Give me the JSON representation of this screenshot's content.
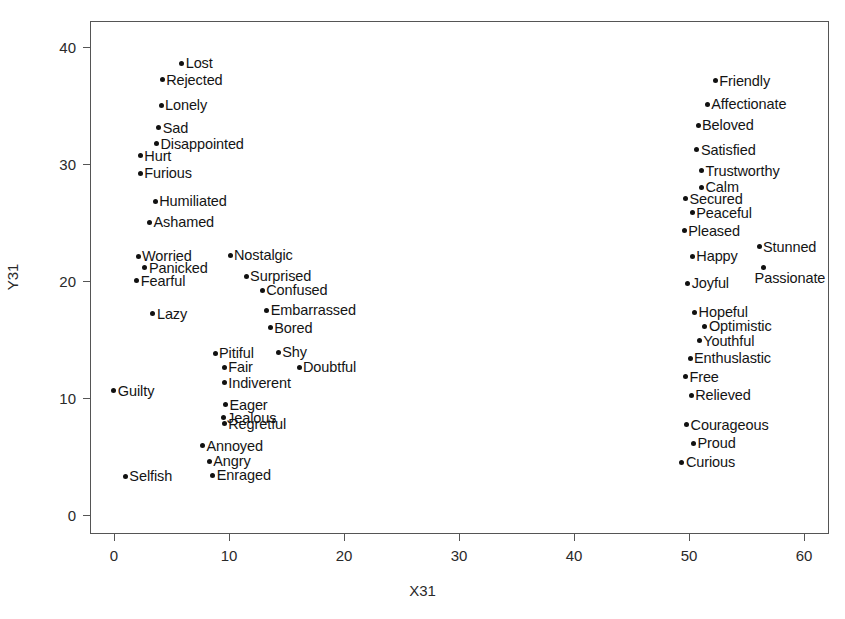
{
  "chart_data": {
    "type": "scatter",
    "title": "",
    "xlabel": "X31",
    "ylabel": "Y31",
    "xlim": [
      -2.1,
      62.5
    ],
    "ylim": [
      -1.8,
      42.2
    ],
    "xticks": [
      0,
      10,
      20,
      30,
      40,
      50,
      60
    ],
    "yticks": [
      0,
      10,
      20,
      30,
      40
    ],
    "grid": false,
    "legend": null,
    "marker": "filled-circle",
    "marker_color": "#111111",
    "points": [
      {
        "label": "Lost",
        "x": 5.8,
        "y": 38.7,
        "label_side": "right"
      },
      {
        "label": "Rejected",
        "x": 4.1,
        "y": 37.3,
        "label_side": "right"
      },
      {
        "label": "Lonely",
        "x": 4.0,
        "y": 35.1,
        "label_side": "right"
      },
      {
        "label": "Sad",
        "x": 3.8,
        "y": 33.2,
        "label_side": "right"
      },
      {
        "label": "Disappointed",
        "x": 3.6,
        "y": 31.8,
        "label_side": "right"
      },
      {
        "label": "Hurt",
        "x": 2.2,
        "y": 30.8,
        "label_side": "right"
      },
      {
        "label": "Furious",
        "x": 2.2,
        "y": 29.3,
        "label_side": "right"
      },
      {
        "label": "Humiliated",
        "x": 3.5,
        "y": 26.9,
        "label_side": "right"
      },
      {
        "label": "Ashamed",
        "x": 3.0,
        "y": 25.1,
        "label_side": "right"
      },
      {
        "label": "Worried",
        "x": 2.0,
        "y": 22.2,
        "label_side": "right"
      },
      {
        "label": "Nostalgic",
        "x": 10.0,
        "y": 22.3,
        "label_side": "right"
      },
      {
        "label": "Panicked",
        "x": 2.6,
        "y": 21.2,
        "label_side": "right"
      },
      {
        "label": "Fearful",
        "x": 1.9,
        "y": 20.1,
        "label_side": "right"
      },
      {
        "label": "Surprised",
        "x": 11.4,
        "y": 20.5,
        "label_side": "right"
      },
      {
        "label": "Confused",
        "x": 12.8,
        "y": 19.3,
        "label_side": "right"
      },
      {
        "label": "Embarrassed",
        "x": 13.2,
        "y": 17.6,
        "label_side": "right"
      },
      {
        "label": "Lazy",
        "x": 3.3,
        "y": 17.3,
        "label_side": "right"
      },
      {
        "label": "Bored",
        "x": 13.5,
        "y": 16.1,
        "label_side": "right"
      },
      {
        "label": "Pitiful",
        "x": 8.7,
        "y": 13.9,
        "label_side": "right"
      },
      {
        "label": "Shy",
        "x": 14.2,
        "y": 14.0,
        "label_side": "right"
      },
      {
        "label": "Fair",
        "x": 9.5,
        "y": 12.7,
        "label_side": "right"
      },
      {
        "label": "Doubtful",
        "x": 16.0,
        "y": 12.7,
        "label_side": "right"
      },
      {
        "label": "Indiverent",
        "x": 9.5,
        "y": 11.4,
        "label_side": "right"
      },
      {
        "label": "Guilty",
        "x": -0.1,
        "y": 10.7,
        "label_side": "right"
      },
      {
        "label": "Eager",
        "x": 9.6,
        "y": 9.5,
        "label_side": "right"
      },
      {
        "label": "Jealous",
        "x": 9.4,
        "y": 8.4,
        "label_side": "right"
      },
      {
        "label": "Regretful",
        "x": 9.5,
        "y": 7.9,
        "label_side": "right"
      },
      {
        "label": "Annoyed",
        "x": 7.6,
        "y": 6.0,
        "label_side": "right"
      },
      {
        "label": "Angry",
        "x": 8.2,
        "y": 4.7,
        "label_side": "right"
      },
      {
        "label": "Selfish",
        "x": 0.9,
        "y": 3.4,
        "label_side": "right"
      },
      {
        "label": "Enraged",
        "x": 8.5,
        "y": 3.5,
        "label_side": "right"
      },
      {
        "label": "Friendly",
        "x": 52.2,
        "y": 37.2,
        "label_side": "right"
      },
      {
        "label": "Affectionate",
        "x": 51.5,
        "y": 35.2,
        "label_side": "right"
      },
      {
        "label": "Beloved",
        "x": 50.7,
        "y": 33.4,
        "label_side": "right"
      },
      {
        "label": "Satisfied",
        "x": 50.6,
        "y": 31.3,
        "label_side": "right"
      },
      {
        "label": "Trustworthy",
        "x": 51.0,
        "y": 29.5,
        "label_side": "right"
      },
      {
        "label": "Calm",
        "x": 51.0,
        "y": 28.1,
        "label_side": "right"
      },
      {
        "label": "Secured",
        "x": 49.6,
        "y": 27.1,
        "label_side": "right"
      },
      {
        "label": "Peaceful",
        "x": 50.2,
        "y": 25.9,
        "label_side": "right"
      },
      {
        "label": "Pleased",
        "x": 49.5,
        "y": 24.4,
        "label_side": "right"
      },
      {
        "label": "Stunned",
        "x": 56.0,
        "y": 23.0,
        "label_side": "right"
      },
      {
        "label": "Happy",
        "x": 50.2,
        "y": 22.2,
        "label_side": "right"
      },
      {
        "label": "Passionate",
        "x": 56.4,
        "y": 21.2,
        "label_side": "below"
      },
      {
        "label": "Joyful",
        "x": 49.8,
        "y": 19.9,
        "label_side": "right"
      },
      {
        "label": "Hopeful",
        "x": 50.4,
        "y": 17.4,
        "label_side": "right"
      },
      {
        "label": "Optimistic",
        "x": 51.3,
        "y": 16.2,
        "label_side": "right"
      },
      {
        "label": "Youthful",
        "x": 50.8,
        "y": 15.0,
        "label_side": "right"
      },
      {
        "label": "Enthuslastic",
        "x": 50.0,
        "y": 13.5,
        "label_side": "right"
      },
      {
        "label": "Free",
        "x": 49.6,
        "y": 11.9,
        "label_side": "right"
      },
      {
        "label": "Relieved",
        "x": 50.1,
        "y": 10.3,
        "label_side": "right"
      },
      {
        "label": "Courageous",
        "x": 49.7,
        "y": 7.8,
        "label_side": "right"
      },
      {
        "label": "Proud",
        "x": 50.3,
        "y": 6.2,
        "label_side": "right"
      },
      {
        "label": "Curious",
        "x": 49.3,
        "y": 4.6,
        "label_side": "right"
      }
    ]
  }
}
